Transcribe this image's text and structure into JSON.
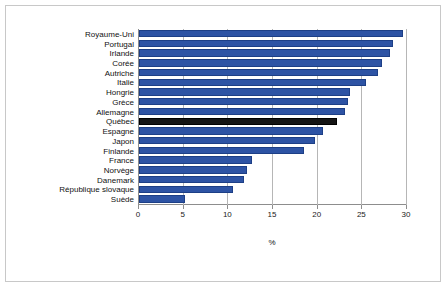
{
  "chart_data": {
    "type": "bar",
    "orientation": "horizontal",
    "title": "",
    "xlabel": "%",
    "ylabel": "",
    "xlim": [
      0,
      30
    ],
    "xticks": [
      0,
      5,
      10,
      15,
      20,
      25,
      30
    ],
    "grid": true,
    "legend": false,
    "highlight_category": "Québec",
    "colors": {
      "bar": "#2d53a4",
      "bar_border": "#1d3f86",
      "highlight": "#141414",
      "axis": "#8d8d8d",
      "gridline": "#b6b6b6",
      "frame": "#c8c8c8",
      "background": "#ffffff",
      "text": "#111111"
    },
    "categories": [
      "Royaume-Uni",
      "Portugal",
      "Irlande",
      "Corée",
      "Autriche",
      "Italie",
      "Hongrie",
      "Grèce",
      "Allemagne",
      "Québec",
      "Espagne",
      "Japon",
      "Finlande",
      "France",
      "Norvège",
      "Danemark",
      "République slovaque",
      "Suède"
    ],
    "values": [
      29.6,
      28.4,
      28.1,
      27.2,
      26.7,
      25.4,
      23.6,
      23.4,
      23.1,
      22.2,
      20.6,
      19.7,
      18.5,
      12.7,
      12.1,
      11.8,
      10.5,
      5.2
    ]
  }
}
